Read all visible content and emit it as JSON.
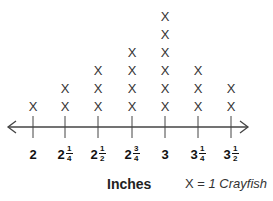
{
  "chart_data": {
    "type": "line-plot",
    "title": "",
    "xlabel": "Inches",
    "ylabel": "",
    "categories": [
      "2",
      "2 1/4",
      "2 1/2",
      "2 3/4",
      "3",
      "3 1/4",
      "3 1/2"
    ],
    "x": [
      2,
      2.25,
      2.5,
      2.75,
      3,
      3.25,
      3.5
    ],
    "values": [
      1,
      2,
      3,
      4,
      6,
      3,
      2
    ],
    "marker": "X",
    "legend": "X = 1 Crayfish",
    "xlim": [
      2,
      3.5
    ],
    "grid": false
  },
  "ticks": [
    {
      "whole": "2",
      "num": "",
      "den": "",
      "px": 33
    },
    {
      "whole": "2",
      "num": "1",
      "den": "4",
      "px": 65
    },
    {
      "whole": "2",
      "num": "1",
      "den": "2",
      "px": 98
    },
    {
      "whole": "2",
      "num": "3",
      "den": "4",
      "px": 132
    },
    {
      "whole": "3",
      "num": "",
      "den": "",
      "px": 165
    },
    {
      "whole": "3",
      "num": "1",
      "den": "4",
      "px": 198
    },
    {
      "whole": "3",
      "num": "1",
      "den": "2",
      "px": 231
    }
  ],
  "legend": {
    "prefix": "X = ",
    "text": "1 Crayfish"
  },
  "axis_label": "Inches"
}
